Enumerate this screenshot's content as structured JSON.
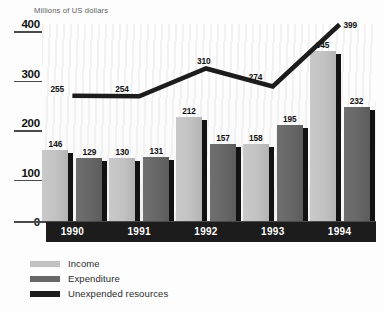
{
  "chart_data": {
    "type": "bar",
    "title": "Millions of US dollars",
    "xlabel": "",
    "ylabel": "Millions of US dollars",
    "categories": [
      "1990",
      "1991",
      "1992",
      "1993",
      "1994"
    ],
    "ylim": [
      0,
      400
    ],
    "yticks": [
      0,
      100,
      200,
      300,
      400
    ],
    "ytick_labels": [
      "0",
      "100",
      "200",
      "300",
      "400"
    ],
    "grid": false,
    "legend_position": "bottom-left",
    "series": [
      {
        "name": "Income",
        "render": "bar",
        "color": "#c2c2c2",
        "values": [
          146,
          130,
          212,
          158,
          345
        ]
      },
      {
        "name": "Expenditure",
        "render": "bar",
        "color": "#676767",
        "values": [
          129,
          131,
          157,
          195,
          232
        ]
      },
      {
        "name": "Unexpended resources",
        "render": "line",
        "color": "#1c1c1c",
        "values": [
          255,
          254,
          310,
          274,
          399
        ]
      }
    ]
  },
  "axis": {
    "y_ticks": [
      {
        "label": "400",
        "value": 400
      },
      {
        "label": "300",
        "value": 300
      },
      {
        "label": "200",
        "value": 200
      },
      {
        "label": "100",
        "value": 100
      },
      {
        "label": "0",
        "value": 0
      }
    ],
    "x_labels": [
      "1990",
      "1991",
      "1992",
      "1993",
      "1994"
    ]
  },
  "legend": {
    "items": [
      {
        "label": "Income",
        "color": "#c2c2c2"
      },
      {
        "label": "Expenditure",
        "color": "#676767"
      },
      {
        "label": "Unexpended resources",
        "color": "#1c1c1c"
      }
    ]
  },
  "colors": {
    "income": "#c2c2c2",
    "expenditure": "#676767",
    "unexpended": "#1c1c1c",
    "axis_band": "#1c1c1c",
    "background": "#fdfdfd"
  }
}
